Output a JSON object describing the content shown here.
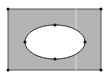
{
  "diagram": {
    "colors": {
      "fill": "#b4b4b4",
      "stroke": "#222222",
      "hole": "#ffffff",
      "seam": "#e6e6e6"
    },
    "rect": {
      "x": 8,
      "y": 9,
      "width": 93,
      "height": 61
    },
    "ellipse": {
      "cx": 55,
      "cy": 42,
      "rx": 30,
      "ry": 17
    },
    "points_count": 8
  }
}
